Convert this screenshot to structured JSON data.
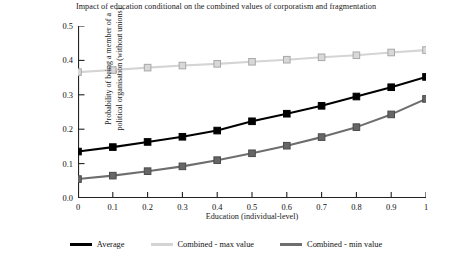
{
  "chart_data": {
    "type": "line",
    "title": "Impact of education conditional on the combined values of corporatism and fragmentation",
    "xlabel": "Education (individual-level)",
    "ylabel": "Probability of being a member of a political organisation (without unions)",
    "ylabel_lines": [
      "Probability of being a member of a",
      "political organisation (without unions)"
    ],
    "x": [
      0,
      0.1,
      0.2,
      0.3,
      0.4,
      0.5,
      0.6,
      0.7,
      0.8,
      0.9,
      1
    ],
    "xticklabels": [
      "0",
      "0.1",
      "0.2",
      "0.3",
      "0.4",
      "0.5",
      "0.6",
      "0.7",
      "0.8",
      "0.9",
      "1"
    ],
    "yticklabels": [
      "0.0",
      "0.1",
      "0.2",
      "0.3",
      "0.4",
      "0.5"
    ],
    "yticks": [
      0.0,
      0.1,
      0.2,
      0.3,
      0.4,
      0.5
    ],
    "xlim": [
      0,
      1
    ],
    "ylim": [
      0,
      0.5
    ],
    "grid": false,
    "legend_position": "bottom",
    "marker": "square",
    "series": [
      {
        "name": "Average",
        "color": "#000000",
        "marker_fill": "#000000",
        "marker_edge": "#000000",
        "values": [
          0.135,
          0.148,
          0.163,
          0.178,
          0.196,
          0.223,
          0.245,
          0.268,
          0.295,
          0.322,
          0.352
        ]
      },
      {
        "name": "Combined - max value",
        "color": "#d4d4d4",
        "marker_fill": "#d8d8d8",
        "marker_edge": "#a8a8a8",
        "values": [
          0.366,
          0.372,
          0.379,
          0.385,
          0.39,
          0.396,
          0.402,
          0.409,
          0.415,
          0.423,
          0.43
        ]
      },
      {
        "name": "Combined - min value",
        "color": "#6e6e6e",
        "marker_fill": "#666666",
        "marker_edge": "#4a4a4a",
        "values": [
          0.055,
          0.065,
          0.078,
          0.092,
          0.11,
          0.13,
          0.152,
          0.177,
          0.206,
          0.243,
          0.288
        ]
      }
    ]
  },
  "legend": {
    "items": [
      {
        "label": "Average",
        "color": "#000000"
      },
      {
        "label": "Combined - max value",
        "color": "#d4d4d4"
      },
      {
        "label": "Combined - min value",
        "color": "#6e6e6e"
      }
    ]
  },
  "axis": {
    "line_color": "#222222"
  }
}
